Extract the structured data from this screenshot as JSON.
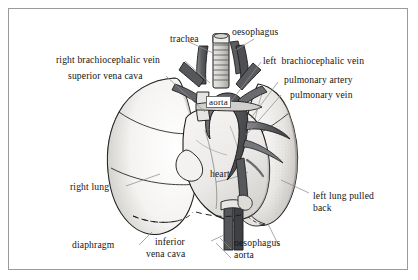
{
  "figure": {
    "frame": {
      "border_color": "#9a9a9a",
      "background": "#ffffff"
    },
    "ink_color": "#1d1d1d",
    "leader_line_color": "#8d8d8d"
  },
  "labels": {
    "trachea": "trachea",
    "oesophagus_top": "oesophagus",
    "right_brachiocephalic_vein": "right brachiocephalic vein",
    "left_brachiocephalic_vein": "left  brachiocephalic vein",
    "superior_vena_cava": "superior vena cava",
    "pulmonary_artery": "pulmonary artery",
    "pulmonary_vein": "pulmonary vein",
    "aorta_boxed": "aorta",
    "heart": "heart",
    "right_lung": "right lung",
    "left_lung_pulled_back_line1": "left lung pulled",
    "left_lung_pulled_back_line2": "back",
    "diaphragm": "diaphragm",
    "inferior_vena_cava_line1": "inferior",
    "inferior_vena_cava_line2": "vena cava",
    "oesophagus_bottom": "oesophagus",
    "aorta_bottom": "aorta"
  },
  "palette": {
    "lung_fill": "#f2f1ef",
    "lung_shade": "#d7d5d2",
    "heart_fill": "#efeeec",
    "vessel_dark": "#4a4a4d",
    "vessel_mid": "#6f7073",
    "aorta_fill": "#5e5f63",
    "outline": "#1d1d1d"
  }
}
